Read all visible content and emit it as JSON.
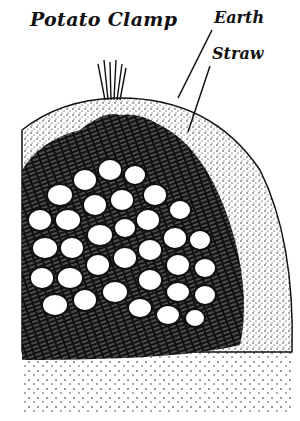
{
  "diagram": {
    "title": "Potato Clamp",
    "labels": [
      {
        "id": "earth",
        "text": "Earth"
      },
      {
        "id": "straw",
        "text": "Straw"
      }
    ],
    "layers": [
      "earth",
      "straw",
      "potatoes",
      "ground"
    ],
    "colors": {
      "ink": "#111111",
      "paper": "#ffffff"
    }
  }
}
